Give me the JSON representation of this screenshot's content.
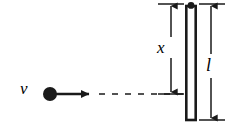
{
  "figure": {
    "kind": "physics-diagram",
    "width": 228,
    "height": 128,
    "background_color": "#ffffff",
    "ink_color": "#1a1a1a"
  },
  "labels": {
    "velocity": "v",
    "impact_distance": "x",
    "rod_length": "l"
  },
  "particle": {
    "name": "projectile-ball",
    "center_x": 50,
    "center_y": 94,
    "radius": 7,
    "fill": "#1a1a1a"
  },
  "velocity_arrow": {
    "name": "velocity-vector",
    "from_x": 56,
    "to_x": 92,
    "y": 94,
    "stroke_width": 2.6
  },
  "trajectory": {
    "name": "dashed-trajectory",
    "from_x": 97,
    "to_x": 184,
    "y": 94,
    "dash_pattern": "6 7",
    "stroke_width": 1.6
  },
  "rod": {
    "name": "pivoted-rod",
    "left": 185,
    "top": 6,
    "width": 11,
    "height": 114,
    "fill": "#ffffff",
    "stroke_width": 2.6
  },
  "pivot": {
    "name": "pivot-point",
    "center_x": 190.5,
    "center_y": 5,
    "radius": 3.2,
    "fill": "#1a1a1a"
  },
  "dimension_x": {
    "name": "dimension-x",
    "line_x": 171,
    "top_y": 4,
    "bottom_y": 94,
    "tick_top": {
      "x1": 157,
      "x2": 185,
      "y": 4
    },
    "tick_bottom": {
      "x1": 157,
      "x2": 185,
      "y": 94
    },
    "stroke_width": 1.5
  },
  "dimension_l": {
    "name": "dimension-l",
    "line_x": 211,
    "top_y": 4,
    "bottom_y": 120,
    "tick_top": {
      "x1": 198,
      "x2": 226,
      "y": 4
    },
    "tick_bottom": {
      "x1": 198,
      "x2": 226,
      "y": 120
    },
    "stroke_width": 1.5
  }
}
